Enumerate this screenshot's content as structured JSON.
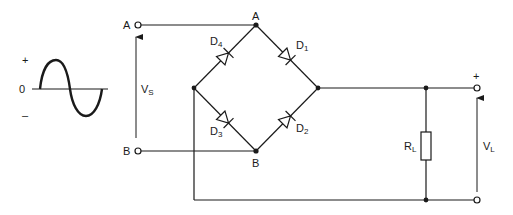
{
  "diagram": {
    "type": "bridge rectifier circuit",
    "colors": {
      "line": "#1a1a1a",
      "background": "#ffffff"
    },
    "waveform": {
      "plus_label": "+",
      "zero_label": "0",
      "minus_label": "–"
    },
    "input": {
      "terminal_a": "A",
      "terminal_b": "B",
      "voltage_label": "V",
      "voltage_sub": "S"
    },
    "bridge": {
      "node_top": "A",
      "node_bottom": "B",
      "diodes": [
        {
          "label": "D",
          "sub": "1"
        },
        {
          "label": "D",
          "sub": "2"
        },
        {
          "label": "D",
          "sub": "3"
        },
        {
          "label": "D",
          "sub": "4"
        }
      ]
    },
    "load": {
      "resistor_label": "R",
      "resistor_sub": "L",
      "voltage_label": "V",
      "voltage_sub": "L",
      "plus_label": "+"
    }
  }
}
